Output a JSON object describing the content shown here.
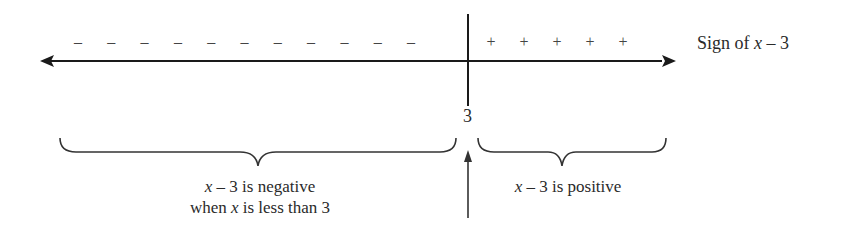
{
  "diagram": {
    "number_line": {
      "critical_value": "3",
      "sign_label_prefix": "Sign of ",
      "sign_label_var": "x",
      "sign_label_suffix": " – 3",
      "negative_sign": "–",
      "positive_sign": "+",
      "negative_count": 11,
      "positive_count": 5
    },
    "annotations": {
      "left_line1_var": "x",
      "left_line1_rest": " – 3 is negative",
      "left_line2_pre": "when ",
      "left_line2_var": "x",
      "left_line2_rest": " is less than 3",
      "right_var": "x",
      "right_rest": " – 3 is positive"
    },
    "colors": {
      "stroke": "#1a1a1a",
      "text": "#2a2a2a"
    }
  }
}
